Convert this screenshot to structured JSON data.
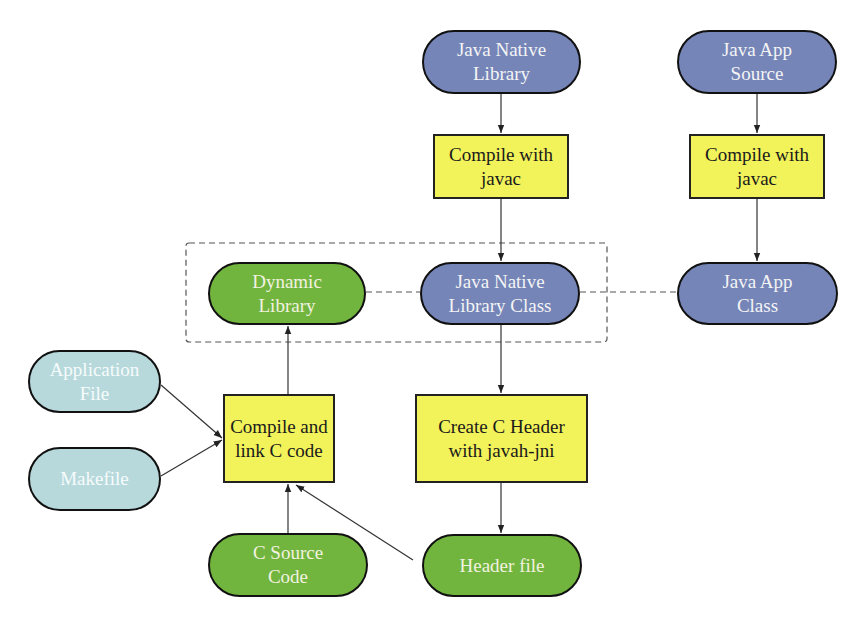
{
  "diagram": {
    "colors": {
      "java_node": "#7585b8",
      "native_node": "#72b53e",
      "input_node": "#b7d9dc",
      "process_box": "#f2f25a",
      "stroke": "#111111"
    },
    "nodes": {
      "java_native_library": {
        "label": "Java Native\nLibrary",
        "shape": "pill",
        "color": "blue"
      },
      "compile_javac_left": {
        "label": "Compile with\njavac",
        "shape": "box"
      },
      "java_app_source": {
        "label": "Java App\nSource",
        "shape": "pill",
        "color": "blue"
      },
      "compile_javac_right": {
        "label": "Compile with\njavac",
        "shape": "box"
      },
      "dynamic_library": {
        "label": "Dynamic\nLibrary",
        "shape": "pill",
        "color": "green"
      },
      "java_native_library_class": {
        "label": "Java Native\nLibrary Class",
        "shape": "pill",
        "color": "blue"
      },
      "java_app_class": {
        "label": "Java App\nClass",
        "shape": "pill",
        "color": "blue"
      },
      "application_file": {
        "label": "Application\nFile",
        "shape": "pill",
        "color": "cyan"
      },
      "makefile": {
        "label": "Makefile",
        "shape": "pill",
        "color": "cyan"
      },
      "compile_link_c": {
        "label": "Compile and\nlink C code",
        "shape": "box"
      },
      "create_c_header": {
        "label": "Create C Header\nwith javah-jni",
        "shape": "box"
      },
      "c_source_code": {
        "label": "C Source\nCode",
        "shape": "pill",
        "color": "green"
      },
      "header_file": {
        "label": "Header file",
        "shape": "pill",
        "color": "green"
      }
    },
    "edges": [
      {
        "from": "java_native_library",
        "to": "compile_javac_left",
        "style": "arrow"
      },
      {
        "from": "compile_javac_left",
        "to": "java_native_library_class",
        "style": "arrow"
      },
      {
        "from": "java_app_source",
        "to": "compile_javac_right",
        "style": "arrow"
      },
      {
        "from": "compile_javac_right",
        "to": "java_app_class",
        "style": "arrow"
      },
      {
        "from": "java_native_library_class",
        "to": "create_c_header",
        "style": "arrow"
      },
      {
        "from": "create_c_header",
        "to": "header_file",
        "style": "arrow"
      },
      {
        "from": "application_file",
        "to": "compile_link_c",
        "style": "arrow"
      },
      {
        "from": "makefile",
        "to": "compile_link_c",
        "style": "arrow"
      },
      {
        "from": "c_source_code",
        "to": "compile_link_c",
        "style": "arrow"
      },
      {
        "from": "header_file",
        "to": "compile_link_c",
        "style": "arrow"
      },
      {
        "from": "compile_link_c",
        "to": "dynamic_library",
        "style": "arrow"
      },
      {
        "from": "dynamic_library",
        "to": "java_native_library_class",
        "style": "dashed"
      },
      {
        "from": "java_native_library_class",
        "to": "java_app_class",
        "style": "dashed"
      }
    ],
    "groups": [
      {
        "name": "runtime-group",
        "members": [
          "dynamic_library",
          "java_native_library_class"
        ],
        "style": "dashed"
      }
    ]
  }
}
